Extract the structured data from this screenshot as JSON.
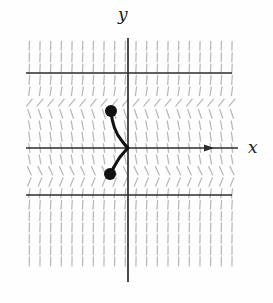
{
  "figure": {
    "title": "",
    "type": "slope-field-with-solution-curve",
    "background_color": "#fefefe"
  },
  "axes": {
    "x_label": "x",
    "y_label": "y",
    "x_axis": {
      "y_pixel": 148,
      "x_start": 26,
      "x_end": 238,
      "has_arrow": true,
      "color": "#2b2b2b"
    },
    "y_axis": {
      "x_pixel": 128,
      "y_start": 38,
      "y_end": 282,
      "has_arrow": false,
      "color": "#2b2b2b"
    },
    "origin": {
      "x": 128,
      "y": 148
    }
  },
  "chart_data": {
    "type": "line",
    "title": "",
    "xlabel": "x",
    "ylabel": "y",
    "grid": false,
    "legend": "none",
    "xlim": [
      -7.8,
      8.1
    ],
    "ylim": [
      -8.6,
      8.6
    ],
    "field": {
      "name": "slope field",
      "color": "#b8b8b8",
      "x_samples": [
        -7.4,
        -6.6,
        -5.8,
        -5.0,
        -4.2,
        -3.4,
        -2.6,
        -1.8,
        -1.0,
        -0.2,
        0.6,
        1.4,
        2.2,
        3.0,
        3.8,
        4.6,
        5.4,
        6.2,
        7.0,
        7.8
      ],
      "y_samples": [
        8.0,
        7.2,
        6.4,
        5.6,
        4.8,
        4.0,
        3.2,
        2.4,
        1.6,
        0.8,
        0.0,
        -0.8,
        -1.6,
        -2.4,
        -3.2,
        -4.0,
        -4.8,
        -5.6,
        -6.4,
        -7.2,
        -8.0
      ],
      "description": "short tangent segments of dy/dx, nearly vertical far from the isoclines, horizontal on the lines y=+3 and y=-2"
    },
    "isoclines": [
      {
        "name": "upper-isocline",
        "y_value": 3.0,
        "y_pixel": 73,
        "x_from": 26,
        "x_to": 232,
        "color": "#2b2b2b",
        "slope": 0
      },
      {
        "name": "lower-isocline",
        "y_value": -2.0,
        "y_pixel": 195,
        "x_from": 26,
        "x_to": 232,
        "color": "#2b2b2b",
        "slope": 0
      }
    ],
    "series": [
      {
        "name": "solution-curve",
        "color": "#111111",
        "points": [
          {
            "x": -0.75,
            "y": 1.55
          },
          {
            "x": -0.7,
            "y": 1.3
          },
          {
            "x": -0.58,
            "y": 0.95
          },
          {
            "x": -0.4,
            "y": 0.6
          },
          {
            "x": -0.18,
            "y": 0.28
          },
          {
            "x": 0.0,
            "y": 0.0
          },
          {
            "x": -0.18,
            "y": -0.28
          },
          {
            "x": -0.4,
            "y": -0.56
          },
          {
            "x": -0.6,
            "y": -0.76
          },
          {
            "x": -0.76,
            "y": -0.88
          }
        ]
      }
    ],
    "markers": [
      {
        "name": "upper-endpoint-dot",
        "x": -0.75,
        "y": 1.55,
        "px": 111,
        "py": 111,
        "radius": 6,
        "color": "#111111"
      },
      {
        "name": "lower-endpoint-dot",
        "x": -0.78,
        "y": -0.9,
        "px": 110,
        "py": 174,
        "radius": 6,
        "color": "#111111"
      }
    ]
  }
}
